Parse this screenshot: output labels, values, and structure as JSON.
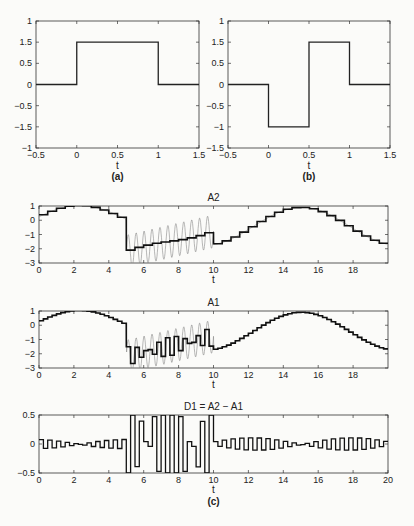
{
  "chart_data": [
    {
      "id": "a",
      "type": "line",
      "caption": "(a)",
      "title": "",
      "xlabel": "t",
      "ylabel": "",
      "xlim": [
        -0.5,
        1.5
      ],
      "ylim": [
        -1,
        1
      ],
      "xticks": [
        "-0.5",
        "0",
        "0.5",
        "1",
        "1.5"
      ],
      "yticks": [
        "1",
        "1.5",
        "0.5",
        "0",
        "-0.5",
        "-1.5",
        "-1"
      ],
      "series": [
        {
          "name": "haar-scaling",
          "x": [
            -0.5,
            0,
            0,
            1,
            1,
            1.5
          ],
          "y": [
            0,
            0,
            1.5,
            1.5,
            0,
            0
          ]
        }
      ]
    },
    {
      "id": "b",
      "type": "line",
      "caption": "(b)",
      "title": "",
      "xlabel": "t",
      "ylabel": "",
      "xlim": [
        -0.5,
        1.5
      ],
      "ylim": [
        -1.5,
        1
      ],
      "xticks": [
        "-0.5",
        "0",
        "0.5",
        "1",
        "1.5"
      ],
      "yticks": [
        "1",
        "1.5",
        "0.5",
        "0",
        "-0.5",
        "-1",
        "-1.5"
      ],
      "series": [
        {
          "name": "haar-wavelet",
          "x": [
            -0.5,
            0,
            0,
            0.5,
            0.5,
            1,
            1,
            1.5
          ],
          "y": [
            0,
            0,
            -1,
            -1,
            1.5,
            1.5,
            0,
            0
          ]
        }
      ]
    },
    {
      "id": "A2",
      "type": "line",
      "title": "A2",
      "xlabel": "t",
      "xlim": [
        0,
        20
      ],
      "ylim": [
        -3.5,
        1
      ],
      "xticks": [
        "0",
        "2",
        "4",
        "6",
        "8",
        "10",
        "12",
        "14",
        "16",
        "18"
      ],
      "yticks": [
        "1",
        "0",
        "-1",
        "-2",
        "-3"
      ],
      "series": [
        {
          "name": "signal",
          "style": "thin gray"
        },
        {
          "name": "approximation A2",
          "style": "thick black step"
        }
      ]
    },
    {
      "id": "A1",
      "type": "line",
      "title": "A1",
      "xlabel": "t",
      "xlim": [
        0,
        20
      ],
      "ylim": [
        -3.5,
        1
      ],
      "xticks": [
        "0",
        "2",
        "4",
        "6",
        "8",
        "10",
        "12",
        "14",
        "16",
        "18"
      ],
      "yticks": [
        "1",
        "0",
        "-1",
        "-2",
        "-3"
      ],
      "series": [
        {
          "name": "signal",
          "style": "thin gray"
        },
        {
          "name": "approximation A1",
          "style": "thick black step"
        }
      ]
    },
    {
      "id": "D1",
      "type": "line",
      "title": "D1 = A2 − A1",
      "xlabel": "t",
      "caption": "(c)",
      "xlim": [
        0,
        20
      ],
      "ylim": [
        -0.5,
        0.5
      ],
      "xticks": [
        "0",
        "2",
        "4",
        "6",
        "8",
        "10",
        "12",
        "14",
        "16",
        "18",
        "20"
      ],
      "yticks": [
        "0.5",
        "0",
        "-0.5"
      ],
      "series": [
        {
          "name": "detail D1",
          "style": "black step"
        }
      ]
    }
  ],
  "labels": {
    "a_caption": "(a)",
    "b_caption": "(b)",
    "c_caption": "(c)",
    "A2_title": "A2",
    "A1_title": "A1",
    "D1_title": "D1 = A2 − A1",
    "t": "t"
  }
}
